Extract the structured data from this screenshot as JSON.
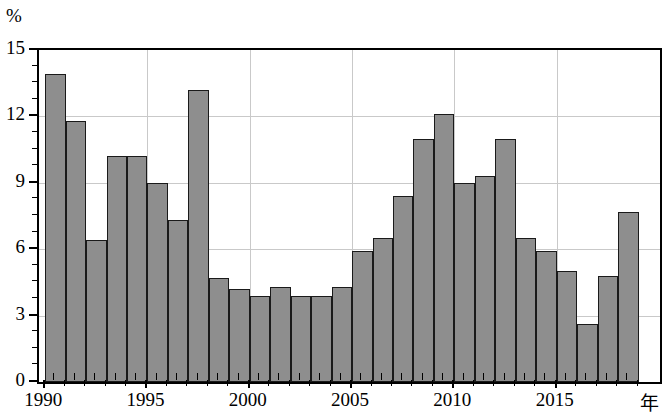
{
  "chart_data": {
    "type": "bar",
    "title": "",
    "subtitle": "",
    "xlabel": "年",
    "ylabel": "%",
    "ylim": [
      0,
      15
    ],
    "ytick_values": [
      0,
      3,
      6,
      9,
      12,
      15
    ],
    "ytick_labels": [
      "0",
      "3",
      "6",
      "9",
      "12",
      "15"
    ],
    "y_minor_step": 0.75,
    "grid": "horizontal at 3,6,9,12; vertical at 1995,2000,2005,2010,2015",
    "legend": "none",
    "bar_color": "#8e8e8e",
    "bar_edge_color": "#1a1a1a",
    "grid_color": "#c9c9c9",
    "axis_color": "#000000",
    "categories": [
      "1990",
      "1991",
      "1992",
      "1993",
      "1994",
      "1995",
      "1996",
      "1997",
      "1998",
      "1999",
      "2000",
      "2001",
      "2002",
      "2003",
      "2004",
      "2005",
      "2006",
      "2007",
      "2008",
      "2009",
      "2010",
      "2011",
      "2012",
      "2013",
      "2014",
      "2015",
      "2016",
      "2017",
      "2018"
    ],
    "values": [
      13.9,
      11.8,
      6.4,
      10.2,
      10.2,
      9.0,
      7.3,
      13.2,
      4.7,
      4.2,
      3.9,
      4.3,
      3.9,
      3.9,
      4.3,
      5.9,
      6.5,
      8.4,
      11.0,
      12.1,
      9.0,
      9.3,
      11.0,
      6.5,
      5.9,
      5.0,
      2.6,
      4.8,
      7.7
    ],
    "xtick_labeled": [
      "1990",
      "1995",
      "2000",
      "2005",
      "2010",
      "2015"
    ]
  },
  "axes": {
    "y_unit_label": "%",
    "x_unit_label": "年"
  }
}
